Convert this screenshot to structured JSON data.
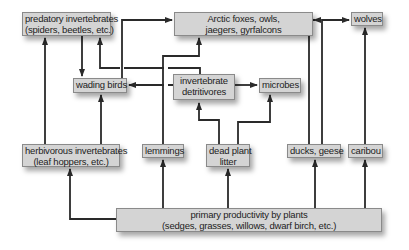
{
  "diagram": {
    "type": "food-web",
    "nodes": {
      "predatory_invertebrates": {
        "line1": "predatory invertebrates",
        "line2": "(spiders, beetles, etc.)"
      },
      "arctic_predators": {
        "line1": "Arctic foxes, owls,",
        "line2": "jaegers, gyrfalcons"
      },
      "wolves": {
        "line1": "wolves"
      },
      "wading_birds": {
        "line1": "wading birds"
      },
      "invertebrate_detritivores": {
        "line1": "invertebrate",
        "line2": "detritivores"
      },
      "microbes": {
        "line1": "microbes"
      },
      "herbivorous_invertebrates": {
        "line1": "herbivorous invertebrates",
        "line2": "(leaf hoppers, etc.)"
      },
      "lemmings": {
        "line1": "lemmings"
      },
      "dead_plant_litter": {
        "line1": "dead plant",
        "line2": "litter"
      },
      "ducks_geese": {
        "line1": "ducks, geese"
      },
      "caribou": {
        "line1": "caribou"
      },
      "primary_productivity": {
        "line1": "primary productivity by plants",
        "line2": "(sedges, grasses, willows, dwarf birch, etc.)"
      }
    },
    "edges": [
      {
        "from": "primary_productivity",
        "to": "herbivorous_invertebrates"
      },
      {
        "from": "primary_productivity",
        "to": "lemmings"
      },
      {
        "from": "primary_productivity",
        "to": "dead_plant_litter"
      },
      {
        "from": "primary_productivity",
        "to": "ducks_geese"
      },
      {
        "from": "primary_productivity",
        "to": "caribou"
      },
      {
        "from": "herbivorous_invertebrates",
        "to": "predatory_invertebrates"
      },
      {
        "from": "herbivorous_invertebrates",
        "to": "wading_birds"
      },
      {
        "from": "predatory_invertebrates",
        "to": "wading_birds"
      },
      {
        "from": "invertebrate_detritivores",
        "to": "predatory_invertebrates"
      },
      {
        "from": "invertebrate_detritivores",
        "to": "wading_birds"
      },
      {
        "from": "invertebrate_detritivores",
        "to": "microbes"
      },
      {
        "from": "dead_plant_litter",
        "to": "invertebrate_detritivores"
      },
      {
        "from": "dead_plant_litter",
        "to": "microbes"
      },
      {
        "from": "wading_birds",
        "to": "arctic_predators"
      },
      {
        "from": "lemmings",
        "to": "arctic_predators"
      },
      {
        "from": "ducks_geese",
        "to": "arctic_predators"
      },
      {
        "from": "ducks_geese",
        "to": "wolves"
      },
      {
        "from": "caribou",
        "to": "wolves"
      }
    ]
  }
}
